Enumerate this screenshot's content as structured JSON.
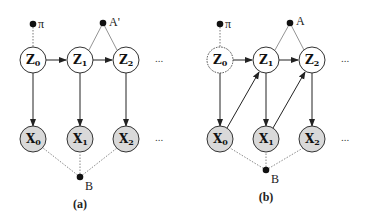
{
  "panels": [
    {
      "caption": "(a)",
      "hidden_nodes": [
        {
          "label": "Z",
          "sub": "0",
          "style": "solid"
        },
        {
          "label": "Z",
          "sub": "1",
          "style": "solid"
        },
        {
          "label": "Z",
          "sub": "2",
          "style": "solid"
        }
      ],
      "observed_nodes": [
        {
          "label": "X",
          "sub": "0"
        },
        {
          "label": "X",
          "sub": "1"
        },
        {
          "label": "X",
          "sub": "2"
        }
      ],
      "initial_param": "π",
      "transition_param": "A'",
      "emission_param": "B",
      "continuation": "...",
      "edges": [
        "Z0->Z1",
        "Z1->Z2",
        "Z0->X0",
        "Z1->X1",
        "Z2->X2"
      ]
    },
    {
      "caption": "(b)",
      "hidden_nodes": [
        {
          "label": "Z",
          "sub": "0",
          "style": "dashed"
        },
        {
          "label": "Z",
          "sub": "1",
          "style": "solid"
        },
        {
          "label": "Z",
          "sub": "2",
          "style": "solid"
        }
      ],
      "observed_nodes": [
        {
          "label": "X",
          "sub": "0"
        },
        {
          "label": "X",
          "sub": "1"
        },
        {
          "label": "X",
          "sub": "2"
        }
      ],
      "initial_param": "π",
      "transition_param": "A",
      "emission_param": "B",
      "continuation": "...",
      "edges": [
        "Z0->Z1",
        "Z1->Z2",
        "Z0->X0",
        "Z1->X1",
        "Z2->X2",
        "X0->Z1",
        "X1->Z2"
      ]
    }
  ],
  "colors": {
    "observed_fill": "#d9d9d9",
    "hidden_fill": "#ffffff",
    "stroke": "#333333",
    "param_dot": "#111111"
  }
}
